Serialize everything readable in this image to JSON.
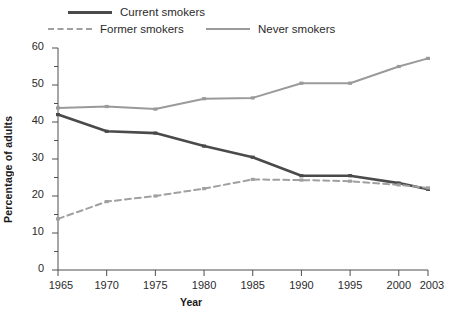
{
  "legend": {
    "items": [
      {
        "label": "Current smokers",
        "style": "solid",
        "color": "#4a4a4a",
        "key": "current"
      },
      {
        "label": "Former smokers",
        "style": "dashed",
        "color": "#a0a0a0",
        "key": "former"
      },
      {
        "label": "Never smokers",
        "style": "solid",
        "color": "#9a9a9a",
        "key": "never"
      }
    ]
  },
  "axes": {
    "ylabel": "Percentage of adults",
    "xlabel": "Year",
    "yticks": [
      "0",
      "10",
      "20",
      "30",
      "40",
      "50",
      "60"
    ],
    "yminor": [
      "5",
      "15",
      "25",
      "35",
      "45",
      "55"
    ],
    "xticks": [
      "1965",
      "1970",
      "1975",
      "1980",
      "1985",
      "1990",
      "1995",
      "2000",
      "2003"
    ]
  },
  "chart_data": {
    "type": "line",
    "title": "",
    "xlabel": "Year",
    "ylabel": "Percentage of adults",
    "x": [
      1965,
      1970,
      1975,
      1980,
      1985,
      1990,
      1995,
      2000,
      2003
    ],
    "xlim": [
      1965,
      2003
    ],
    "ylim": [
      0,
      60
    ],
    "grid": false,
    "legend_position": "top",
    "ytick_values": [
      0,
      10,
      20,
      30,
      40,
      50,
      60
    ],
    "ytick_minor_values": [
      5,
      15,
      25,
      35,
      45,
      55
    ],
    "series": [
      {
        "name": "Current smokers",
        "color": "#4a4a4a",
        "style": "solid",
        "width": 2.6,
        "values": [
          42.0,
          37.5,
          37.0,
          33.5,
          30.5,
          25.5,
          25.5,
          23.5,
          21.8
        ]
      },
      {
        "name": "Former smokers",
        "color": "#a0a0a0",
        "style": "dashed",
        "width": 2.0,
        "values": [
          13.8,
          18.5,
          20.0,
          22.0,
          24.5,
          24.3,
          24.0,
          23.0,
          22.2
        ]
      },
      {
        "name": "Never smokers",
        "color": "#9a9a9a",
        "style": "solid",
        "width": 2.0,
        "values": [
          43.8,
          44.2,
          43.5,
          46.3,
          46.5,
          50.5,
          50.5,
          55.0,
          57.2
        ]
      }
    ]
  }
}
